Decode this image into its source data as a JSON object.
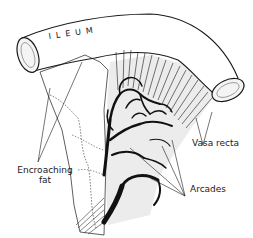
{
  "figure": {
    "labels": {
      "ileum": "ILEUM",
      "encroaching_fat_line1": "Encroaching",
      "encroaching_fat_line2": "fat",
      "vasa_recta": "Vasa recta",
      "arcades": "Arcades"
    },
    "colors": {
      "ink": "#1a1a1a",
      "background": "#ffffff",
      "mesentery_shade": "#ececec"
    }
  }
}
